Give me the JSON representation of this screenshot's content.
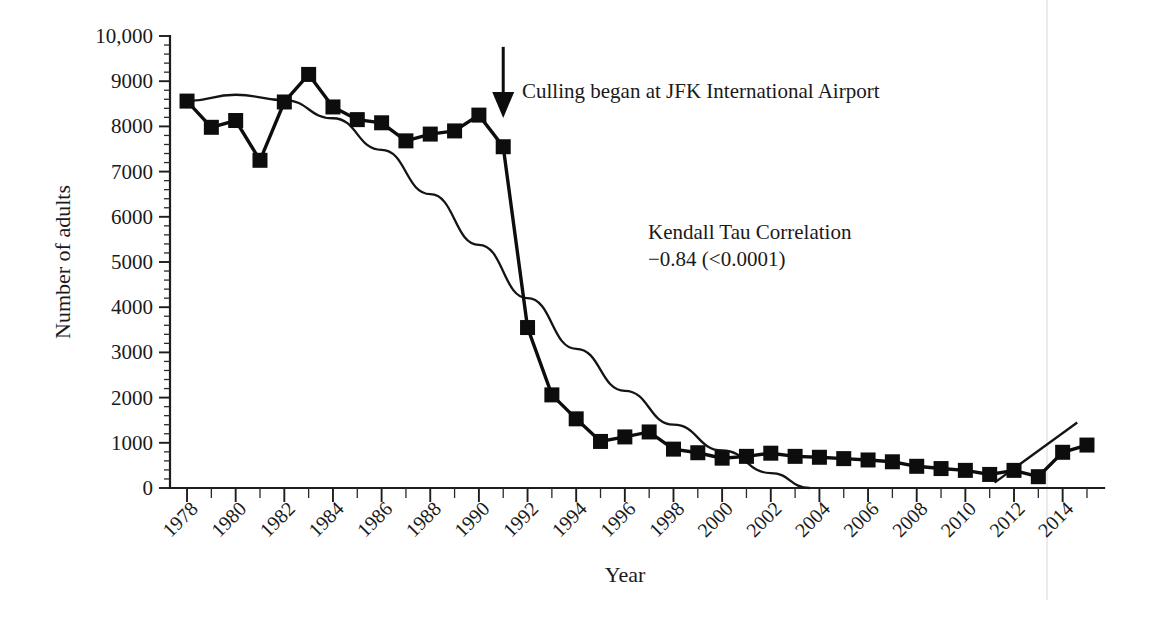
{
  "chart_data": {
    "type": "line",
    "title": "",
    "xlabel": "Year",
    "ylabel": "Number of adults",
    "xlim": [
      1977.3,
      2015.7
    ],
    "ylim": [
      0,
      10000
    ],
    "grid": false,
    "legend": "none",
    "x_tick_step_major": 2,
    "x_tick_step_minor": 1,
    "y_tick_step_major": 1000,
    "y_tick_step_minor": 200,
    "x_tick_labels": [
      "1978",
      "1980",
      "1982",
      "1984",
      "1986",
      "1988",
      "1990",
      "1992",
      "1994",
      "1996",
      "1998",
      "2000",
      "2002",
      "2004",
      "2006",
      "2008",
      "2010",
      "2012",
      "2014"
    ],
    "y_tick_labels": [
      "0",
      "1000",
      "2000",
      "3000",
      "4000",
      "5000",
      "6000",
      "7000",
      "8000",
      "9000",
      "10,000"
    ],
    "x_tick_label_rotation": -45,
    "marker": "square",
    "marker_color": "#0d0d0d",
    "line_color": "#0d0d0d",
    "series": [
      {
        "name": "Number of adults",
        "x": [
          1978,
          1979,
          1980,
          1981,
          1982,
          1983,
          1984,
          1985,
          1986,
          1987,
          1988,
          1989,
          1990,
          1991,
          1992,
          1993,
          1994,
          1995,
          1996,
          1997,
          1998,
          1999,
          2000,
          2001,
          2002,
          2003,
          2004,
          2005,
          2006,
          2007,
          2008,
          2009,
          2010,
          2011,
          2012,
          2013,
          2014,
          2015
        ],
        "values": [
          8560,
          7980,
          8130,
          7250,
          8540,
          9150,
          8430,
          8150,
          8080,
          7680,
          7830,
          7900,
          8250,
          7550,
          3550,
          2060,
          1530,
          1030,
          1130,
          1240,
          860,
          780,
          660,
          700,
          770,
          700,
          680,
          650,
          620,
          580,
          480,
          430,
          390,
          300,
          390,
          250,
          790,
          950
        ]
      }
    ],
    "trend_lines": [
      {
        "name": "declining-trend-curve",
        "x": [
          1978,
          1980,
          1982,
          1984,
          1986,
          1988,
          1990,
          1992,
          1994,
          1996,
          1998,
          2000,
          2002,
          2003.6
        ],
        "values": [
          8560,
          8700,
          8580,
          8180,
          7480,
          6500,
          5380,
          4200,
          3080,
          2150,
          1400,
          830,
          330,
          0
        ]
      },
      {
        "name": "rising-trend-line",
        "x": [
          2011.2,
          2014.6
        ],
        "values": [
          120,
          1450
        ]
      }
    ],
    "annotations": [
      {
        "name": "culling-annotation",
        "text": "Culling began at JFK International Airport",
        "arrow_target_year": 1991,
        "arrow_target_value": 8100
      },
      {
        "name": "correlation-annotation",
        "line1": "Kendall Tau Correlation",
        "line2": "−0.84 (<0.0001)"
      }
    ]
  }
}
